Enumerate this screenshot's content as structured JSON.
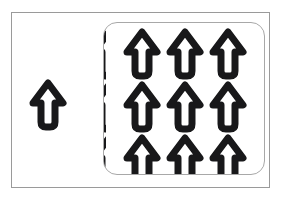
{
  "figure": {
    "title": "",
    "background_color": "#ffffff",
    "outer_frame": {
      "name": "outer-frame",
      "x": 11,
      "y": 12,
      "width": 259,
      "height": 176,
      "stroke_color": "#9a9a9a",
      "stroke_width": 1,
      "fill": "#ffffff"
    },
    "group_region": {
      "name": "grouped-arrows-region",
      "x": 103,
      "y": 22,
      "width": 162,
      "height": 153,
      "corner_radius": 14,
      "stroke_color": "#a8a8a8",
      "stroke_width": 1,
      "fill": "transparent",
      "clips_contents": true
    },
    "arrow_style": {
      "fill": "#ffffff",
      "stroke_color": "#18181a",
      "stroke_width": 7,
      "direction": "up",
      "head_width": 36,
      "total_height": 50,
      "shaft_width": 14,
      "shaft_rounded_bottom": true
    },
    "single_arrow": {
      "name": "standalone-arrow",
      "x": 29,
      "y": 79,
      "width": 38,
      "height": 52,
      "direction": "up",
      "clipped": false
    },
    "arrow_grid": {
      "name": "arrow-grid",
      "rows": 3,
      "columns": 3,
      "column_x": [
        19,
        62,
        105
      ],
      "row_y": [
        5,
        58,
        111
      ],
      "cell_spacing_x": 43,
      "cell_spacing_y": 53,
      "arrows": [
        {
          "row": 0,
          "col": 0,
          "x": 19,
          "y": 5,
          "direction": "up",
          "clipped": false
        },
        {
          "row": 0,
          "col": 1,
          "x": 62,
          "y": 5,
          "direction": "up",
          "clipped": false
        },
        {
          "row": 0,
          "col": 2,
          "x": 105,
          "y": 5,
          "direction": "up",
          "clipped": false
        },
        {
          "row": 1,
          "col": 0,
          "x": 19,
          "y": 58,
          "direction": "up",
          "clipped": false
        },
        {
          "row": 1,
          "col": 1,
          "x": 62,
          "y": 58,
          "direction": "up",
          "clipped": false
        },
        {
          "row": 1,
          "col": 2,
          "x": 105,
          "y": 58,
          "direction": "up",
          "clipped": false
        },
        {
          "row": 2,
          "col": 0,
          "x": 19,
          "y": 111,
          "direction": "up",
          "clipped": true
        },
        {
          "row": 2,
          "col": 1,
          "x": 62,
          "y": 111,
          "direction": "up",
          "clipped": true
        },
        {
          "row": 2,
          "col": 2,
          "x": 105,
          "y": 111,
          "direction": "up",
          "clipped": true
        }
      ]
    },
    "edge_arrow_tips": {
      "name": "clipped-edge-arrow-tips",
      "description": "partial arrow tips clipped at the left border of the grouped region",
      "count": 3,
      "tips": [
        {
          "x": -14,
          "y": 5
        },
        {
          "x": -14,
          "y": 58
        },
        {
          "x": -14,
          "y": 111
        }
      ]
    }
  }
}
